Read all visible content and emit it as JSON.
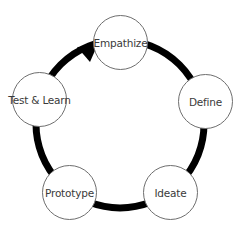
{
  "diagram": {
    "type": "cycle",
    "direction": "clockwise",
    "colors": {
      "ring": "#000000",
      "node_border": "#6e6e6e",
      "node_fill": "#ffffff",
      "text": "#3a3a3a"
    },
    "nodes": [
      {
        "id": "empathize",
        "label": "Empathize"
      },
      {
        "id": "define",
        "label": "Define"
      },
      {
        "id": "ideate",
        "label": "Ideate"
      },
      {
        "id": "prototype",
        "label": "Prototype"
      },
      {
        "id": "test-learn",
        "label": "Test & Learn"
      }
    ],
    "edges": [
      {
        "from": "empathize",
        "to": "define"
      },
      {
        "from": "define",
        "to": "ideate"
      },
      {
        "from": "ideate",
        "to": "prototype"
      },
      {
        "from": "prototype",
        "to": "test-learn"
      },
      {
        "from": "test-learn",
        "to": "empathize",
        "arrowhead": true
      }
    ]
  }
}
